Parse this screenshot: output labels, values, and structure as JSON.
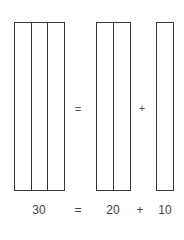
{
  "diagram": {
    "groups": [
      {
        "id": "thirty",
        "strips": 3,
        "value": "30"
      },
      {
        "id": "twenty",
        "strips": 2,
        "value": "20"
      },
      {
        "id": "ten",
        "strips": 1,
        "value": "10"
      }
    ],
    "operators": {
      "equals": "=",
      "plus": "+"
    },
    "equation": {
      "lhs": "30",
      "eq": "=",
      "term1": "20",
      "plus": "+",
      "term2": "10"
    },
    "colors": {
      "stroke": "#3a3a3a",
      "text": "#444444",
      "background": "#ffffff"
    }
  }
}
